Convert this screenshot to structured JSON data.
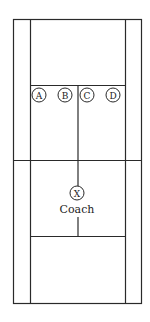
{
  "diagram": {
    "type": "tennis-court-drill",
    "colors": {
      "line": "#2a2a2a",
      "background": "#ffffff"
    },
    "players": [
      {
        "id": "A",
        "label": "A",
        "cx": 39,
        "cy": 95
      },
      {
        "id": "B",
        "label": "B",
        "cx": 65,
        "cy": 95
      },
      {
        "id": "C",
        "label": "C",
        "cx": 87,
        "cy": 95
      },
      {
        "id": "D",
        "label": "D",
        "cx": 113,
        "cy": 95
      }
    ],
    "coach": {
      "marker": "X",
      "label": "Coach",
      "cx": 77,
      "cy": 193
    }
  }
}
